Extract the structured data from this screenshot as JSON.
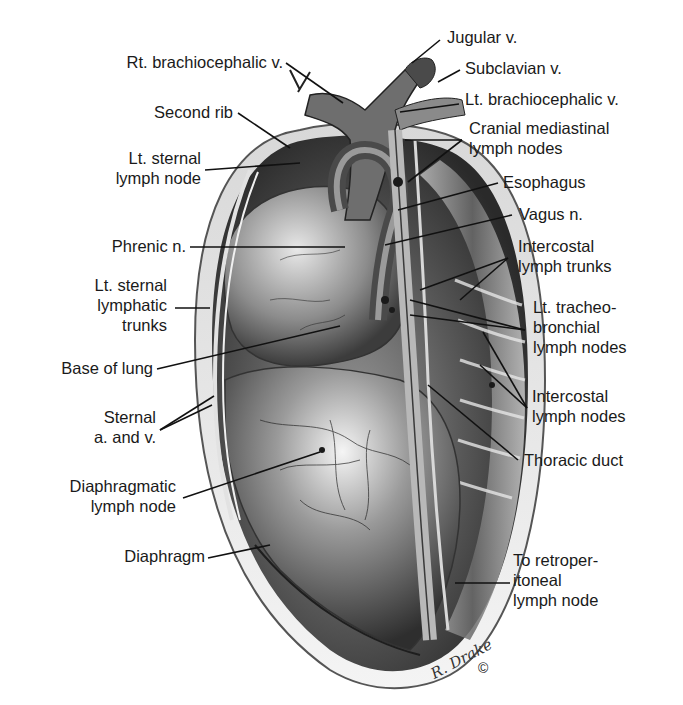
{
  "figure": {
    "signature": "R. Drake",
    "copyright_mark": "©"
  },
  "labels": {
    "left": [
      {
        "id": "rt_brachiocephalic_v",
        "lines": [
          "Rt. brachiocephalic v."
        ]
      },
      {
        "id": "second_rib",
        "lines": [
          "Second rib"
        ]
      },
      {
        "id": "lt_sternal_lymph_node",
        "lines": [
          "Lt. sternal",
          "lymph node"
        ]
      },
      {
        "id": "phrenic_n",
        "lines": [
          "Phrenic n."
        ]
      },
      {
        "id": "lt_sternal_lymphatic_trunks",
        "lines": [
          "Lt. sternal",
          "lymphatic",
          "trunks"
        ]
      },
      {
        "id": "base_of_lung",
        "lines": [
          "Base of lung"
        ]
      },
      {
        "id": "sternal_a_and_v",
        "lines": [
          "Sternal",
          "a. and v."
        ]
      },
      {
        "id": "diaphragmatic_lymph_node",
        "lines": [
          "Diaphragmatic",
          "lymph node"
        ]
      },
      {
        "id": "diaphragm",
        "lines": [
          "Diaphragm"
        ]
      }
    ],
    "right": [
      {
        "id": "jugular_v",
        "lines": [
          "Jugular v."
        ]
      },
      {
        "id": "subclavian_v",
        "lines": [
          "Subclavian v."
        ]
      },
      {
        "id": "lt_brachiocephalic_v",
        "lines": [
          "Lt. brachiocephalic v."
        ]
      },
      {
        "id": "cranial_mediastinal_lymph_nodes",
        "lines": [
          "Cranial mediastinal",
          "lymph nodes"
        ]
      },
      {
        "id": "esophagus",
        "lines": [
          "Esophagus"
        ]
      },
      {
        "id": "vagus_n",
        "lines": [
          "Vagus n."
        ]
      },
      {
        "id": "intercostal_lymph_trunks",
        "lines": [
          "Intercostal",
          "lymph trunks"
        ]
      },
      {
        "id": "lt_tracheobronchial_lymph_nodes",
        "lines": [
          "Lt. tracheo-",
          "bronchial",
          "lymph nodes"
        ]
      },
      {
        "id": "intercostal_lymph_nodes",
        "lines": [
          "Intercostal",
          "lymph nodes"
        ]
      },
      {
        "id": "thoracic_duct",
        "lines": [
          "Thoracic duct"
        ]
      },
      {
        "id": "to_retroperitoneal_lymph_node",
        "lines": [
          "To retroper-",
          "itoneal",
          "lymph node"
        ]
      }
    ]
  },
  "colors": {
    "ink": "#1a1a1a",
    "shade_dark": "#3a3a3a",
    "shade_mid": "#7a7a7a",
    "shade_light": "#cfcfcf",
    "background": "#ffffff"
  }
}
